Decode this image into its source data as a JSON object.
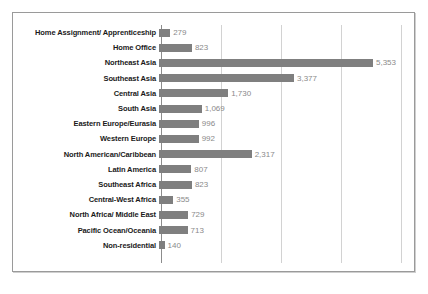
{
  "chart_data": {
    "type": "bar",
    "orientation": "horizontal",
    "title": "",
    "subtitle": "",
    "xlabel": "",
    "ylabel": "",
    "grid": true,
    "legend": null,
    "xlim": [
      0,
      6000
    ],
    "gridlines": [
      1500,
      3000,
      4500,
      6000
    ],
    "categories": [
      "Home Assignment/ Apprenticeship",
      "Home Office",
      "Northeast Asia",
      "Southeast Asia",
      "Central Asia",
      "South Asia",
      "Eastern Europe/Eurasia",
      "Western Europe",
      "North American/Caribbean",
      "Latin America",
      "Southeast Africa",
      "Central-West Africa",
      "North Africa/ Middle East",
      "Pacific Ocean/Oceania",
      "Non-residential"
    ],
    "values": [
      279,
      823,
      5353,
      3377,
      1730,
      1069,
      996,
      992,
      2317,
      807,
      823,
      355,
      729,
      713,
      140
    ],
    "value_labels": [
      "279",
      "823",
      "5,353",
      "3,377",
      "1,730",
      "1,069",
      "996",
      "992",
      "2,317",
      "807",
      "823",
      "355",
      "729",
      "713",
      "140"
    ],
    "colors": {
      "bar": "#7f7f7f",
      "gridline": "#d2d2d2",
      "axis": "#8c8c8c",
      "label_text": "#1a1a1a",
      "value_text": "#8a8a8a",
      "background": "#ffffff",
      "frame_border": "#9a9a9a"
    }
  }
}
